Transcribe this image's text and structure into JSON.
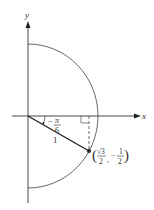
{
  "diagram": {
    "type": "unit-circle-half",
    "axes": {
      "x_label": "x",
      "y_label": "y"
    },
    "angle": {
      "label_sign": "−",
      "label_numerator": "π",
      "label_denominator": "6",
      "value": "-π/6"
    },
    "radius_label": "1",
    "point": {
      "x_numerator": "√3",
      "x_denominator": "2",
      "y_sign": "−",
      "y_numerator": "1",
      "y_denominator": "2",
      "open_paren": "(",
      "close_paren": ")",
      "comma": ","
    },
    "colors": {
      "line": "#333333",
      "background": "#ffffff"
    }
  }
}
